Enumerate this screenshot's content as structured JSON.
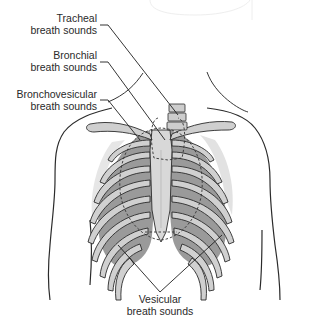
{
  "diagram": {
    "colors": {
      "background": "#ffffff",
      "outline": "#2b2b2b",
      "rib": "#cfcfcf",
      "lung_fill": "#8e8e8e",
      "lung_light": "#b8b8b8",
      "sternum": "#d8d8d8",
      "shadow": "#e4e4e4",
      "dashed": "#333333"
    },
    "labels": [
      {
        "id": "tracheal",
        "line1": "Tracheal",
        "line2": "breath sounds"
      },
      {
        "id": "bronchial",
        "line1": "Bronchial",
        "line2": "breath sounds"
      },
      {
        "id": "bronchovesicular",
        "line1": "Bronchovesicular",
        "line2": "breath sounds"
      },
      {
        "id": "vesicular",
        "line1": "Vesicular",
        "line2": "breath sounds"
      }
    ]
  }
}
